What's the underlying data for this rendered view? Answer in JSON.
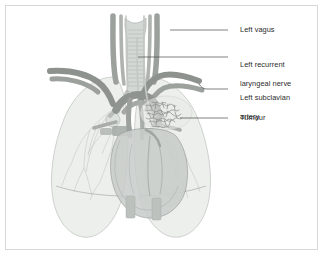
{
  "figure": {
    "frame_color": "#d8d8d8",
    "background_color": "#ffffff",
    "leader_line_color": "#4a4a4a",
    "text_color": "#2b2b2b"
  },
  "labels": [
    {
      "id": "left-vagus",
      "text": "Left vagus",
      "lines": [
        "Left vagus"
      ],
      "text_x": 240,
      "text_y": 26,
      "leader": {
        "x1": 228,
        "y1": 30,
        "x2": 170,
        "y2": 30,
        "anchor_x": 170,
        "anchor_y": 30
      }
    },
    {
      "id": "left-recurrent-laryngeal-nerve",
      "text": "Left recurrent laryngeal nerve",
      "lines": [
        "Left recurrent",
        "laryngeal nerve"
      ],
      "text_x": 240,
      "text_y": 52,
      "leader": {
        "x1": 228,
        "y1": 57,
        "x2": 138,
        "y2": 57,
        "anchor_x": 138,
        "anchor_y": 57
      }
    },
    {
      "id": "left-subclavian-artery",
      "text": "Left subclavian artery",
      "lines": [
        "Left subclavian",
        "artery"
      ],
      "text_x": 240,
      "text_y": 85,
      "leader": {
        "x1": 228,
        "y1": 89,
        "x2": 205,
        "y2": 89,
        "anchor_x": 199,
        "anchor_y": 84
      }
    },
    {
      "id": "tumour",
      "text": "Tumour",
      "lines": [
        "Tumour"
      ],
      "text_x": 240,
      "text_y": 114,
      "leader": {
        "x1": 228,
        "y1": 118,
        "x2": 180,
        "y2": 118,
        "anchor_x": 180,
        "anchor_y": 118
      }
    }
  ],
  "anatomy": {
    "lung_fill": "#eceeec",
    "lung_stroke": "#b9bdb9",
    "lung_vessel": "#ccd2cd",
    "trachea_fill": "#d2d6d2",
    "trachea_stroke": "#aeb3ae",
    "vessel_dark": "#8f9491",
    "vessel_mid": "#a3a8a5",
    "vessel_light": "#b9bebb",
    "nerve_color": "#c3c8c5",
    "heart_fill": "#c9cdcb",
    "heart_stroke": "#9aa09d",
    "tumour_color": "#8d928f",
    "diaphragm_fill": "#bcc1be",
    "parts": [
      {
        "name": "trachea",
        "label": "Trachea with cartilage rings"
      },
      {
        "name": "right-lung",
        "label": "Right lung"
      },
      {
        "name": "left-lung",
        "label": "Left lung"
      },
      {
        "name": "heart",
        "label": "Heart"
      },
      {
        "name": "aortic-arch",
        "label": "Aortic arch"
      },
      {
        "name": "left-subclavian-artery",
        "label": "Left subclavian artery"
      },
      {
        "name": "right-subclavian-artery",
        "label": "Right subclavian artery"
      },
      {
        "name": "left-vagus-nerve",
        "label": "Left vagus nerve"
      },
      {
        "name": "left-recurrent-laryngeal-nerve",
        "label": "Left recurrent laryngeal nerve"
      },
      {
        "name": "tumour-mass",
        "label": "Tumour mass in left hilum"
      },
      {
        "name": "diaphragm-crura",
        "label": "Diaphragm crura"
      }
    ]
  }
}
